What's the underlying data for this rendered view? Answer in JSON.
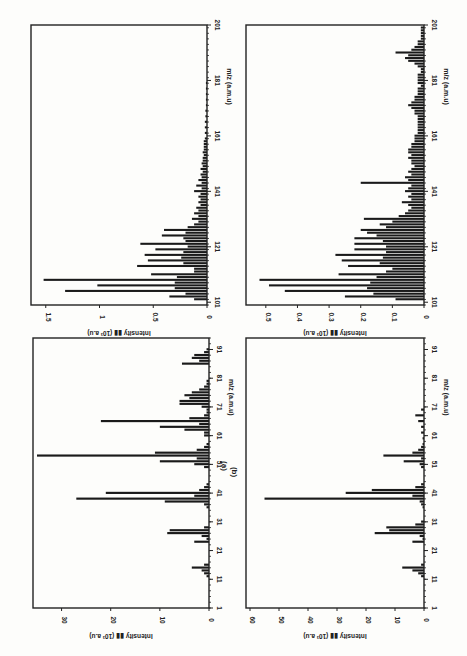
{
  "figure": {
    "panel_labels": [
      "(a)",
      "(b)"
    ],
    "xlabel": "m/z (a.m.u)",
    "ylabel_prefix": "Intensity",
    "ylabel_unit": "(10³ a.u)",
    "colors": {
      "bar": "#1a1a1a",
      "frame": "#222222",
      "paper": "#fdfdfb"
    }
  },
  "chart_data": [
    {
      "id": "a-low",
      "type": "bar",
      "title": "(a)",
      "xlabel": "m/z (a.m.u)",
      "ylabel": "Intensity (10^3 a.u)",
      "xlim": [
        1,
        95
      ],
      "ylim": [
        0,
        35
      ],
      "xticks": [
        1,
        11,
        21,
        31,
        41,
        51,
        61,
        71,
        81,
        91
      ],
      "yticks": [
        0,
        10,
        20,
        30
      ],
      "x": [
        12,
        13,
        14,
        15,
        16,
        24,
        25,
        26,
        27,
        28,
        29,
        36,
        37,
        38,
        39,
        40,
        41,
        42,
        43,
        44,
        50,
        51,
        52,
        53,
        54,
        55,
        56,
        57,
        58,
        61,
        62,
        63,
        64,
        65,
        66,
        67,
        68,
        69,
        70,
        71,
        72,
        73,
        74,
        75,
        76,
        77,
        78,
        79,
        80,
        86,
        87,
        88,
        89,
        90,
        91
      ],
      "values": [
        0.5,
        1,
        1.5,
        3.5,
        1,
        3,
        0.5,
        1.5,
        8.5,
        8,
        1,
        0.5,
        1,
        9,
        27,
        3,
        21,
        2,
        1,
        0.5,
        1,
        3,
        10,
        2.5,
        35,
        11,
        2.5,
        1,
        0.5,
        1,
        1,
        5,
        10,
        2,
        22,
        4,
        1,
        0.5,
        0.5,
        1.5,
        6,
        6,
        4,
        5,
        3.5,
        2,
        1,
        0.5,
        0.5,
        5.5,
        2,
        3.5,
        3,
        1,
        0.5
      ]
    },
    {
      "id": "a-high",
      "type": "bar",
      "title": "(a)",
      "xlabel": "m/z (a.m.u)",
      "ylabel": "Intensity (10^3 a.u)",
      "xlim": [
        100,
        201
      ],
      "ylim": [
        0,
        1.6
      ],
      "xticks": [
        101,
        121,
        141,
        161,
        181,
        201
      ],
      "yticks": [
        0,
        0.5,
        1,
        1.5
      ],
      "x": [
        102,
        103,
        104,
        105,
        106,
        107,
        108,
        109,
        110,
        111,
        112,
        113,
        114,
        115,
        116,
        117,
        118,
        119,
        120,
        121,
        122,
        123,
        124,
        125,
        126,
        127,
        128,
        129,
        130,
        131,
        132,
        133,
        134,
        135,
        136,
        137,
        138,
        139,
        140,
        141,
        142,
        143,
        144,
        145,
        146,
        147,
        148,
        149,
        150,
        151,
        152,
        153,
        154,
        155,
        156,
        157,
        158,
        159,
        160,
        162,
        164,
        166,
        168,
        170,
        172,
        174,
        176,
        178,
        180
      ],
      "values": [
        0.12,
        0.35,
        0.2,
        1.32,
        0.3,
        1.02,
        0.3,
        1.52,
        0.28,
        0.52,
        0.12,
        0.12,
        0.65,
        0.22,
        0.55,
        0.24,
        0.58,
        0.22,
        0.48,
        0.18,
        0.62,
        0.2,
        0.22,
        0.42,
        0.2,
        0.4,
        0.18,
        0.12,
        0.08,
        0.14,
        0.08,
        0.12,
        0.08,
        0.1,
        0.06,
        0.08,
        0.06,
        0.08,
        0.06,
        0.12,
        0.05,
        0.1,
        0.05,
        0.08,
        0.05,
        0.06,
        0.04,
        0.06,
        0.04,
        0.05,
        0.04,
        0.04,
        0.03,
        0.04,
        0.03,
        0.03,
        0.03,
        0.03,
        0.02,
        0.02,
        0.02,
        0.02,
        0.015,
        0.015,
        0.01,
        0.01,
        0.01,
        0.01,
        0.01
      ]
    },
    {
      "id": "b-low",
      "type": "bar",
      "title": "(b)",
      "xlabel": "m/z (a.m.u)",
      "ylabel": "Intensity (10^3 a.u)",
      "xlim": [
        1,
        95
      ],
      "ylim": [
        0,
        60
      ],
      "xticks": [
        1,
        11,
        21,
        31,
        41,
        51,
        61,
        71,
        81,
        91
      ],
      "yticks": [
        0,
        10,
        20,
        30,
        40,
        50,
        60
      ],
      "x": [
        12,
        13,
        14,
        15,
        16,
        24,
        25,
        26,
        27,
        28,
        29,
        30,
        31,
        36,
        37,
        38,
        39,
        40,
        41,
        42,
        43,
        44,
        50,
        51,
        52,
        53,
        54,
        55,
        56,
        57,
        58,
        60,
        62,
        64,
        66,
        68,
        70
      ],
      "values": [
        1,
        2,
        4,
        7.5,
        1,
        4,
        0.5,
        1.5,
        17,
        12,
        13,
        3,
        1,
        0.5,
        1,
        1.5,
        55,
        4,
        27,
        18,
        3,
        1,
        1,
        1.5,
        7,
        1,
        14,
        4,
        2,
        1,
        0.5,
        0.5,
        1,
        1,
        2,
        3,
        1
      ]
    },
    {
      "id": "b-high",
      "type": "bar",
      "title": "(b)",
      "xlabel": "m/z (a.m.u)",
      "ylabel": "Intensity (10^3 a.u)",
      "xlim": [
        100,
        201
      ],
      "ylim": [
        0,
        0.55
      ],
      "xticks": [
        101,
        121,
        141,
        161,
        181,
        201
      ],
      "yticks": [
        0,
        0.1,
        0.2,
        0.3,
        0.4,
        0.5
      ],
      "x": [
        102,
        103,
        104,
        105,
        106,
        107,
        108,
        109,
        110,
        111,
        112,
        113,
        114,
        115,
        116,
        117,
        118,
        119,
        120,
        121,
        122,
        123,
        124,
        125,
        126,
        127,
        128,
        129,
        130,
        131,
        132,
        133,
        134,
        135,
        136,
        137,
        138,
        139,
        140,
        141,
        142,
        143,
        144,
        145,
        146,
        147,
        148,
        149,
        150,
        151,
        152,
        153,
        154,
        155,
        156,
        157,
        158,
        159,
        160,
        161,
        162,
        163,
        164,
        165,
        166,
        167,
        168,
        169,
        170,
        171,
        172,
        173,
        174,
        175,
        176,
        177,
        178,
        179,
        180,
        181,
        182,
        183,
        184,
        185,
        186,
        187,
        188,
        189,
        190,
        191,
        192,
        193,
        194,
        195,
        196,
        197,
        198,
        199,
        200
      ],
      "values": [
        0.09,
        0.25,
        0.16,
        0.44,
        0.18,
        0.49,
        0.17,
        0.52,
        0.15,
        0.27,
        0.12,
        0.1,
        0.24,
        0.14,
        0.26,
        0.13,
        0.28,
        0.12,
        0.22,
        0.12,
        0.22,
        0.13,
        0.22,
        0.15,
        0.18,
        0.2,
        0.12,
        0.14,
        0.1,
        0.19,
        0.08,
        0.06,
        0.05,
        0.04,
        0.05,
        0.07,
        0.04,
        0.05,
        0.04,
        0.06,
        0.05,
        0.04,
        0.2,
        0.05,
        0.06,
        0.04,
        0.05,
        0.04,
        0.03,
        0.04,
        0.04,
        0.05,
        0.04,
        0.05,
        0.05,
        0.04,
        0.04,
        0.03,
        0.03,
        0.03,
        0.02,
        0.02,
        0.02,
        0.02,
        0.02,
        0.02,
        0.02,
        0.03,
        0.03,
        0.04,
        0.05,
        0.04,
        0.03,
        0.03,
        0.02,
        0.02,
        0.02,
        0.01,
        0.02,
        0.02,
        0.02,
        0.02,
        0.01,
        0.01,
        0.02,
        0.03,
        0.05,
        0.06,
        0.05,
        0.09,
        0.04,
        0.03,
        0.02,
        0.02,
        0.01,
        0.01,
        0.01,
        0.01,
        0.01
      ]
    }
  ],
  "layout": {
    "panels": [
      {
        "chart": 1,
        "left": 31,
        "top": 25,
        "width": 176,
        "height": 280
      },
      {
        "chart": 0,
        "left": 33,
        "top": 338,
        "width": 176,
        "height": 270
      },
      {
        "chart": 3,
        "left": 246,
        "top": 25,
        "width": 178,
        "height": 280
      },
      {
        "chart": 2,
        "left": 246,
        "top": 338,
        "width": 178,
        "height": 270
      }
    ]
  }
}
